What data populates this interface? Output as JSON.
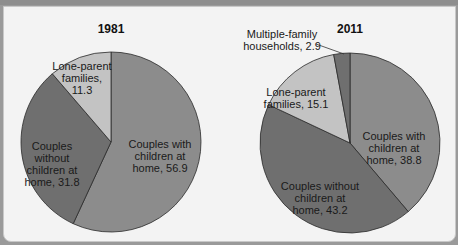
{
  "chart_data": [
    {
      "type": "pie",
      "title": "1981",
      "categories": [
        "Couples with children at home",
        "Couples without children at home",
        "Lone-parent families"
      ],
      "values": [
        56.9,
        31.8,
        11.3
      ],
      "labels": [
        [
          "Couples with",
          "children at",
          "home, 56.9"
        ],
        [
          "Couples",
          "without",
          "children at",
          "home, 31.8"
        ],
        [
          "Lone-parent",
          "families,",
          "11.3"
        ]
      ],
      "colors": [
        "#8c8c8c",
        "#6f6f6f",
        "#c3c3c3"
      ],
      "legend": "none"
    },
    {
      "type": "pie",
      "title": "2011",
      "categories": [
        "Couples with children at home",
        "Couples without children at home",
        "Lone-parent families",
        "Multiple-family households"
      ],
      "values": [
        38.8,
        43.2,
        15.1,
        2.9
      ],
      "labels": [
        [
          "Couples with",
          "children at",
          "home, 38.8"
        ],
        [
          "Couples without",
          "children at",
          "home, 43.2"
        ],
        [
          "Lone-parent",
          "families, 15.1"
        ],
        [
          "Multiple-family",
          "households, 2.9"
        ]
      ],
      "colors": [
        "#8c8c8c",
        "#6f6f6f",
        "#c3c3c3",
        "#6f6f6f"
      ],
      "legend": "none"
    }
  ]
}
